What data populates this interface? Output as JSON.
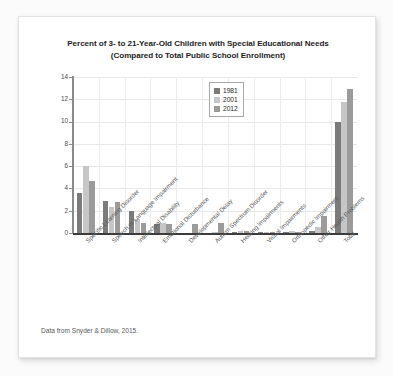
{
  "card": {
    "title_line1": "Percent of 3- to 21-Year-Old Children with Special Educational Needs",
    "title_line2": "(Compared to Total Public School Enrollment)",
    "footer": "Data from Snyder & Dillow, 2015."
  },
  "chart_data": {
    "type": "bar",
    "title": "Percent of 3- to 21-Year-Old Children with Special Educational Needs (Compared to Total Public School Enrollment)",
    "subtitle": "(Compared to Total Public School Enrollment)",
    "xlabel": "",
    "ylabel": "",
    "ylim": [
      0,
      14
    ],
    "yticks": [
      0,
      2,
      4,
      6,
      8,
      10,
      12,
      14
    ],
    "grid": true,
    "legend_position": "upper center",
    "source_note": "Data from Snyder & Dillow, 2015.",
    "categories": [
      "Specific Learning Disorder",
      "Speech or Language Impairment",
      "Intellectual Disability",
      "Emotional Disturbance",
      "Developmental Delay",
      "Autism Spectrum Disorder",
      "Hearing Impairments",
      "Visual Impairments",
      "Orthopedic Impairment",
      "Other Health Problems",
      "Total"
    ],
    "series": [
      {
        "name": "1981",
        "color": "#7b7b7b",
        "values": [
          3.6,
          2.9,
          2.0,
          0.8,
          0.0,
          0.0,
          0.1,
          0.1,
          0.1,
          0.2,
          10.0
        ]
      },
      {
        "name": "2001",
        "color": "#c6c6c6",
        "values": [
          6.0,
          2.3,
          1.3,
          0.9,
          0.0,
          0.05,
          0.15,
          0.05,
          0.15,
          0.5,
          11.8
        ]
      },
      {
        "name": "2012",
        "color": "#9b9b9b",
        "values": [
          4.7,
          2.8,
          0.9,
          0.8,
          0.8,
          0.9,
          0.15,
          0.05,
          0.1,
          1.5,
          12.9
        ]
      }
    ]
  }
}
